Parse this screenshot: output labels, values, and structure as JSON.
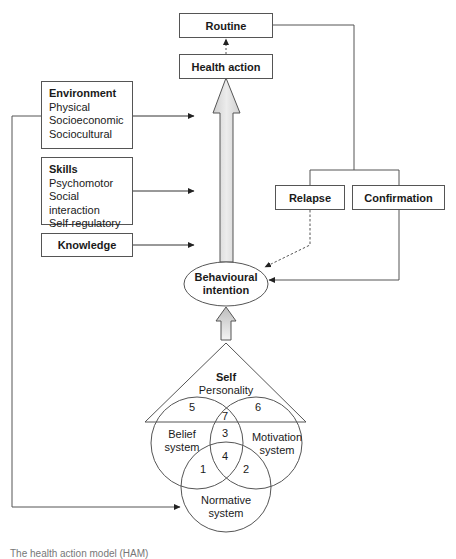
{
  "boxes": {
    "routine": "Routine",
    "health_action": "Health action",
    "environment": {
      "title": "Environment",
      "items": [
        "Physical",
        "Socioeconomic",
        "Sociocultural"
      ]
    },
    "skills": {
      "title": "Skills",
      "items": [
        "Psychomotor",
        "Social interaction",
        "Self-regulatory"
      ]
    },
    "knowledge": "Knowledge",
    "relapse": "Relapse",
    "confirmation": "Confirmation"
  },
  "behavioural_intention": {
    "line1": "Behavioural",
    "line2": "intention"
  },
  "self": {
    "title": "Self",
    "subtitle": "Personality"
  },
  "venn": {
    "belief": {
      "line1": "Belief",
      "line2": "system"
    },
    "motivation": {
      "line1": "Motivation",
      "line2": "system"
    },
    "normative": {
      "line1": "Normative",
      "line2": "system"
    },
    "regions": [
      "1",
      "2",
      "3",
      "4",
      "5",
      "6",
      "7"
    ]
  },
  "colors": {
    "stroke": "#555555",
    "arrow_fill": "#d9d9d9"
  },
  "caption": "The health action model (HAM)"
}
